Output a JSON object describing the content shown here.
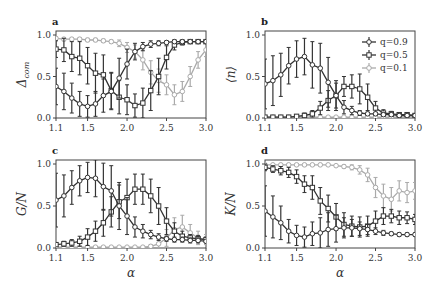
{
  "chart_data": [
    {
      "type": "line",
      "panel": "a",
      "title": "",
      "xlabel": "",
      "ylabel": "Δ_com",
      "xlim": [
        1.1,
        3.0
      ],
      "ylim": [
        0.0,
        1.0
      ],
      "xticks": [
        "1.1",
        "1.5",
        "2.0",
        "2.5",
        "3.0"
      ],
      "yticks": [
        "0.0",
        "0.5",
        "1.0"
      ],
      "x": [
        1.1,
        1.2,
        1.3,
        1.4,
        1.5,
        1.6,
        1.7,
        1.8,
        1.9,
        2.0,
        2.1,
        2.2,
        2.3,
        2.4,
        2.5,
        2.6,
        2.7,
        2.8,
        2.9,
        3.0
      ],
      "series": [
        {
          "name": "q=0.9",
          "marker": "circle",
          "color": "#333333",
          "values": [
            0.38,
            0.32,
            0.24,
            0.17,
            0.14,
            0.17,
            0.27,
            0.32,
            0.48,
            0.65,
            0.8,
            0.86,
            0.89,
            0.9,
            0.91,
            0.92,
            0.92,
            0.92,
            0.92,
            0.92
          ],
          "err": [
            0.22,
            0.22,
            0.18,
            0.15,
            0.13,
            0.15,
            0.2,
            0.22,
            0.24,
            0.18,
            0.1,
            0.05,
            0.04,
            0.03,
            0.02,
            0.02,
            0.02,
            0.02,
            0.02,
            0.02
          ]
        },
        {
          "name": "q=0.5",
          "marker": "square",
          "color": "#333333",
          "values": [
            0.83,
            0.82,
            0.74,
            0.72,
            0.63,
            0.54,
            0.52,
            0.33,
            0.25,
            0.22,
            0.15,
            0.18,
            0.33,
            0.5,
            0.73,
            0.88,
            0.91,
            0.92,
            0.92,
            0.92
          ],
          "err": [
            0.1,
            0.14,
            0.18,
            0.2,
            0.22,
            0.24,
            0.24,
            0.22,
            0.2,
            0.18,
            0.14,
            0.18,
            0.24,
            0.22,
            0.14,
            0.06,
            0.03,
            0.02,
            0.02,
            0.02
          ]
        },
        {
          "name": "q=0.1",
          "marker": "circle",
          "color": "#aaaaaa",
          "values": [
            0.96,
            0.95,
            0.95,
            0.95,
            0.94,
            0.94,
            0.93,
            0.92,
            0.9,
            0.85,
            0.8,
            0.7,
            0.55,
            0.45,
            0.4,
            0.28,
            0.32,
            0.5,
            0.7,
            0.82
          ],
          "err": [
            0.02,
            0.02,
            0.02,
            0.02,
            0.02,
            0.02,
            0.02,
            0.02,
            0.04,
            0.06,
            0.08,
            0.12,
            0.14,
            0.14,
            0.12,
            0.12,
            0.12,
            0.12,
            0.1,
            0.08
          ]
        }
      ]
    },
    {
      "type": "line",
      "panel": "b",
      "xlabel": "",
      "ylabel": "⟨n⟩",
      "xlim": [
        1.1,
        3.0
      ],
      "ylim": [
        0.0,
        1.0
      ],
      "xticks": [
        "1.1",
        "1.5",
        "2.0",
        "2.5",
        "3.0"
      ],
      "yticks": [
        "0.0",
        "0.5",
        "1.0"
      ],
      "legend": {
        "position": "upper right",
        "entries": [
          "q=0.9",
          "q=0.5",
          "q=0.1"
        ]
      },
      "x": [
        1.1,
        1.2,
        1.3,
        1.4,
        1.5,
        1.6,
        1.7,
        1.8,
        1.9,
        2.0,
        2.1,
        2.2,
        2.3,
        2.4,
        2.5,
        2.6,
        2.7,
        2.8,
        2.9,
        3.0
      ],
      "series": [
        {
          "name": "q=0.9",
          "marker": "circle",
          "color": "#333333",
          "values": [
            0.41,
            0.45,
            0.52,
            0.63,
            0.71,
            0.74,
            0.64,
            0.6,
            0.43,
            0.27,
            0.13,
            0.09,
            0.06,
            0.05,
            0.05,
            0.04,
            0.04,
            0.03,
            0.03,
            0.03
          ],
          "err": [
            0.3,
            0.3,
            0.26,
            0.22,
            0.22,
            0.22,
            0.28,
            0.3,
            0.3,
            0.18,
            0.08,
            0.05,
            0.03,
            0.02,
            0.02,
            0.02,
            0.02,
            0.02,
            0.02,
            0.02
          ]
        },
        {
          "name": "q=0.5",
          "marker": "square",
          "color": "#333333",
          "values": [
            0.01,
            0.01,
            0.01,
            0.01,
            0.02,
            0.03,
            0.05,
            0.12,
            0.21,
            0.27,
            0.38,
            0.38,
            0.35,
            0.25,
            0.12,
            0.06,
            0.05,
            0.04,
            0.04,
            0.03
          ],
          "err": [
            0.01,
            0.01,
            0.01,
            0.01,
            0.02,
            0.03,
            0.04,
            0.08,
            0.12,
            0.15,
            0.12,
            0.14,
            0.18,
            0.16,
            0.08,
            0.04,
            0.03,
            0.02,
            0.02,
            0.02
          ]
        },
        {
          "name": "q=0.1",
          "marker": "circle",
          "color": "#aaaaaa",
          "values": [
            0.01,
            0.01,
            0.01,
            0.01,
            0.01,
            0.01,
            0.01,
            0.01,
            0.01,
            0.01,
            0.01,
            0.01,
            0.01,
            0.01,
            0.01,
            0.01,
            0.01,
            0.01,
            0.01,
            0.01
          ],
          "err": [
            0.01,
            0.01,
            0.01,
            0.01,
            0.01,
            0.01,
            0.01,
            0.01,
            0.01,
            0.01,
            0.01,
            0.01,
            0.01,
            0.01,
            0.01,
            0.01,
            0.01,
            0.01,
            0.01,
            0.01
          ]
        }
      ]
    },
    {
      "type": "line",
      "panel": "c",
      "xlabel": "α",
      "ylabel": "G/N",
      "xlim": [
        1.1,
        3.0
      ],
      "ylim": [
        0.0,
        1.0
      ],
      "xticks": [
        "1.1",
        "1.5",
        "2.0",
        "2.5",
        "3.0"
      ],
      "yticks": [
        "0.0",
        "0.5",
        "1.0"
      ],
      "x": [
        1.1,
        1.2,
        1.3,
        1.4,
        1.5,
        1.6,
        1.7,
        1.8,
        1.9,
        2.0,
        2.1,
        2.2,
        2.3,
        2.4,
        2.5,
        2.6,
        2.7,
        2.8,
        2.9,
        3.0
      ],
      "series": [
        {
          "name": "q=0.9",
          "marker": "circle",
          "color": "#333333",
          "values": [
            0.57,
            0.62,
            0.72,
            0.8,
            0.84,
            0.83,
            0.73,
            0.68,
            0.5,
            0.38,
            0.25,
            0.2,
            0.16,
            0.13,
            0.11,
            0.1,
            0.1,
            0.09,
            0.09,
            0.08
          ],
          "err": [
            0.32,
            0.25,
            0.2,
            0.18,
            0.18,
            0.22,
            0.28,
            0.3,
            0.28,
            0.22,
            0.12,
            0.08,
            0.05,
            0.04,
            0.03,
            0.03,
            0.03,
            0.03,
            0.03,
            0.02
          ]
        },
        {
          "name": "q=0.5",
          "marker": "square",
          "color": "#333333",
          "values": [
            0.04,
            0.05,
            0.06,
            0.08,
            0.13,
            0.2,
            0.3,
            0.43,
            0.55,
            0.6,
            0.7,
            0.7,
            0.62,
            0.5,
            0.32,
            0.2,
            0.14,
            0.12,
            0.11,
            0.1
          ],
          "err": [
            0.02,
            0.03,
            0.04,
            0.06,
            0.1,
            0.12,
            0.16,
            0.18,
            0.2,
            0.22,
            0.18,
            0.18,
            0.2,
            0.22,
            0.16,
            0.1,
            0.06,
            0.04,
            0.04,
            0.03
          ]
        },
        {
          "name": "q=0.1",
          "marker": "circle",
          "color": "#aaaaaa",
          "values": [
            0.01,
            0.01,
            0.01,
            0.01,
            0.01,
            0.01,
            0.01,
            0.01,
            0.01,
            0.01,
            0.01,
            0.01,
            0.02,
            0.05,
            0.12,
            0.22,
            0.25,
            0.18,
            0.12,
            0.1
          ],
          "err": [
            0.01,
            0.01,
            0.01,
            0.01,
            0.01,
            0.01,
            0.01,
            0.01,
            0.01,
            0.01,
            0.01,
            0.01,
            0.02,
            0.05,
            0.1,
            0.14,
            0.14,
            0.1,
            0.08,
            0.06
          ]
        }
      ]
    },
    {
      "type": "line",
      "panel": "d",
      "xlabel": "α",
      "ylabel": "K/N",
      "xlim": [
        1.1,
        3.0
      ],
      "ylim": [
        0.0,
        1.0
      ],
      "xticks": [
        "1.1",
        "1.5",
        "2.0",
        "2.5",
        "3.0"
      ],
      "yticks": [
        "0.0",
        "0.5",
        "1.0"
      ],
      "x": [
        1.1,
        1.2,
        1.3,
        1.4,
        1.5,
        1.6,
        1.7,
        1.8,
        1.9,
        2.0,
        2.1,
        2.2,
        2.3,
        2.4,
        2.5,
        2.6,
        2.7,
        2.8,
        2.9,
        3.0
      ],
      "series": [
        {
          "name": "q=0.9",
          "marker": "circle",
          "color": "#333333",
          "values": [
            0.44,
            0.37,
            0.3,
            0.2,
            0.15,
            0.13,
            0.17,
            0.18,
            0.22,
            0.23,
            0.24,
            0.24,
            0.23,
            0.22,
            0.2,
            0.18,
            0.17,
            0.16,
            0.16,
            0.16
          ],
          "err": [
            0.3,
            0.25,
            0.2,
            0.14,
            0.12,
            0.12,
            0.14,
            0.18,
            0.2,
            0.16,
            0.12,
            0.1,
            0.08,
            0.06,
            0.04,
            0.03,
            0.02,
            0.02,
            0.02,
            0.02
          ]
        },
        {
          "name": "q=0.5",
          "marker": "square",
          "color": "#333333",
          "values": [
            0.96,
            0.94,
            0.92,
            0.9,
            0.85,
            0.76,
            0.72,
            0.56,
            0.47,
            0.37,
            0.28,
            0.26,
            0.25,
            0.26,
            0.32,
            0.38,
            0.38,
            0.36,
            0.36,
            0.34
          ],
          "err": [
            0.04,
            0.04,
            0.05,
            0.06,
            0.08,
            0.1,
            0.14,
            0.16,
            0.16,
            0.16,
            0.14,
            0.12,
            0.12,
            0.12,
            0.12,
            0.1,
            0.08,
            0.08,
            0.07,
            0.06
          ]
        },
        {
          "name": "q=0.1",
          "marker": "circle",
          "color": "#aaaaaa",
          "values": [
            0.99,
            0.99,
            0.99,
            0.99,
            0.99,
            0.99,
            0.99,
            0.99,
            0.99,
            0.98,
            0.97,
            0.96,
            0.93,
            0.87,
            0.72,
            0.62,
            0.58,
            0.68,
            0.66,
            0.68
          ],
          "err": [
            0.01,
            0.01,
            0.01,
            0.01,
            0.01,
            0.01,
            0.01,
            0.01,
            0.01,
            0.01,
            0.02,
            0.03,
            0.05,
            0.08,
            0.12,
            0.14,
            0.14,
            0.12,
            0.12,
            0.1
          ]
        }
      ]
    }
  ],
  "panels": {
    "a": {
      "letter": "a",
      "ylabel": "Δ",
      "ylabel_sub": "com",
      "xlabel": ""
    },
    "b": {
      "letter": "b",
      "ylabel": "⟨n⟩",
      "xlabel": ""
    },
    "c": {
      "letter": "c",
      "ylabel": "G/N",
      "xlabel": "α"
    },
    "d": {
      "letter": "d",
      "ylabel": "K/N",
      "xlabel": "α"
    }
  },
  "legend": {
    "entries": [
      "q=0.9",
      "q=0.5",
      "q=0.1"
    ]
  }
}
